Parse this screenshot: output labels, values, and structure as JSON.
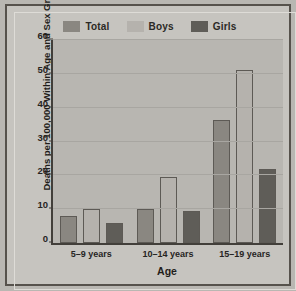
{
  "chart_data": {
    "type": "bar",
    "title": "",
    "xlabel": "Age",
    "ylabel": "Deaths per 100,000 Within Age and Sex Groups",
    "categories": [
      "5–9 years",
      "10–14 years",
      "15–19 years"
    ],
    "series": [
      {
        "name": "Total",
        "color": "#8a8781",
        "values": [
          8,
          10,
          36.5
        ]
      },
      {
        "name": "Boys",
        "color": "#b5b2ad",
        "values": [
          10,
          19.5,
          51
        ]
      },
      {
        "name": "Girls",
        "color": "#5f5d58",
        "values": [
          6,
          9.5,
          22
        ]
      }
    ],
    "ylim": [
      0,
      60
    ],
    "yticks": [
      0,
      10,
      20,
      30,
      40,
      50,
      60
    ],
    "grid": true,
    "legend_position": "top-right"
  },
  "legend": {
    "items": [
      {
        "label": "Total"
      },
      {
        "label": "Boys"
      },
      {
        "label": "Girls"
      }
    ]
  },
  "axes": {
    "y_title": "Deaths per 100,000 Within Age and Sex Groups",
    "x_title": "Age",
    "y_tick_labels": [
      "0",
      "10",
      "20",
      "30",
      "40",
      "50",
      "60"
    ],
    "x_tick_labels": [
      "5–9 years",
      "10–14 years",
      "15–19 years"
    ]
  }
}
